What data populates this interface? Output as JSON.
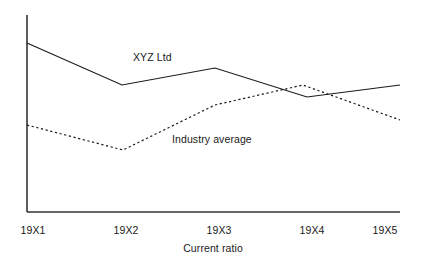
{
  "chart_data": {
    "type": "line",
    "title": "",
    "xlabel": "Current ratio",
    "ylabel": "",
    "categories": [
      "19X1",
      "19X2",
      "19X3",
      "19X4",
      "19X5"
    ],
    "grid": false,
    "legend_position": "inline-annotation",
    "xlim": [
      0,
      4
    ],
    "ylim": [
      0,
      10
    ],
    "series": [
      {
        "name": "XYZ Ltd",
        "style": "solid",
        "color": "#1a1a1a",
        "values": [
          8.6,
          6.5,
          7.3,
          6.1,
          6.8
        ],
        "pixel_points": "27,43 122,85 215,68 307,97 400,85",
        "annotation": "XYZ Ltd"
      },
      {
        "name": "Industry average",
        "style": "dotted",
        "color": "#1a1a1a",
        "values": [
          4.4,
          3.2,
          5.4,
          6.5,
          4.7
        ],
        "pixel_points": "27,125 123,150 215,105 303,85 400,120",
        "annotation": "Industry average"
      }
    ],
    "axes": {
      "y_axis_pixels": "27,15 27,212",
      "x_axis_pixels": "27,212 400,212",
      "color": "#333333"
    },
    "tick_pixel_x": [
      33,
      126,
      219,
      312,
      385
    ],
    "axis_title_pixel": [
      213,
      243
    ]
  },
  "labels": {
    "tick_0": "19X1",
    "tick_1": "19X2",
    "tick_2": "19X3",
    "tick_3": "19X4",
    "tick_4": "19X5",
    "axis_title": "Current ratio",
    "series_xyz": "XYZ Ltd",
    "series_industry": "Industry average"
  }
}
